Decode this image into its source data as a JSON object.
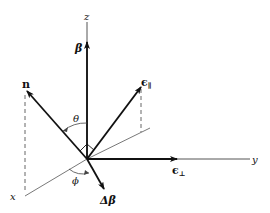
{
  "diagram": {
    "type": "3d-coordinate-vectors",
    "axes": {
      "z": "z",
      "y": "y",
      "x": "x"
    },
    "vectors": {
      "beta": "β",
      "n": "n",
      "eps_par": "ϵ",
      "eps_par_sub": "∥",
      "eps_perp": "ϵ",
      "eps_perp_sub": "⊥",
      "delta_beta": "Δβ"
    },
    "angles": {
      "theta": "θ",
      "phi": "ϕ"
    },
    "colors": {
      "ink": "#111111",
      "thin": "#555555",
      "background": "#ffffff"
    }
  }
}
